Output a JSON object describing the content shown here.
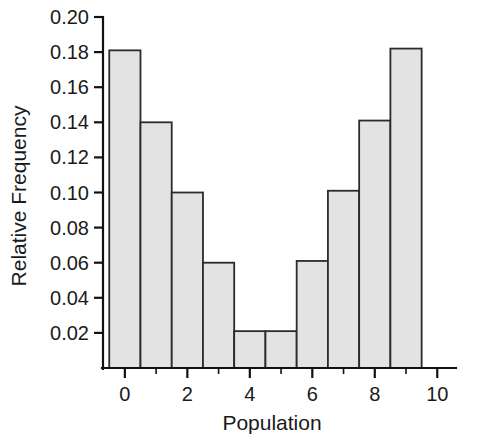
{
  "chart_data": {
    "type": "bar",
    "title": "",
    "subtitle": "",
    "xlabel": "Population",
    "ylabel": "Relative Frequency",
    "categories": [
      0,
      1,
      2,
      3,
      4,
      5,
      6,
      7,
      8,
      9
    ],
    "values": [
      0.181,
      0.14,
      0.1,
      0.06,
      0.021,
      0.021,
      0.061,
      0.101,
      0.141,
      0.182
    ],
    "series": [
      {
        "name": "Relative Frequency",
        "values": [
          0.181,
          0.14,
          0.1,
          0.06,
          0.021,
          0.021,
          0.061,
          0.101,
          0.141,
          0.182
        ]
      }
    ],
    "bar_width": 1.0,
    "xlim": [
      -0.7,
      10.6
    ],
    "ylim": [
      0.0,
      0.2
    ],
    "x_ticks_major": [
      0,
      2,
      4,
      6,
      8,
      10
    ],
    "x_tick_labels": [
      "0",
      "2",
      "4",
      "6",
      "8",
      "10"
    ],
    "x_ticks_minor": [
      1,
      3,
      5,
      7,
      9
    ],
    "y_ticks_major": [
      0.02,
      0.04,
      0.06,
      0.08,
      0.1,
      0.12,
      0.14,
      0.16,
      0.18,
      0.2
    ],
    "y_tick_labels": [
      "0.02",
      "0.04",
      "0.06",
      "0.08",
      "0.10",
      "0.12",
      "0.14",
      "0.16",
      "0.18",
      "0.20"
    ],
    "grid": false,
    "legend": false,
    "legend_position": "none",
    "bar_fill_color": "#e3e3e3",
    "bar_edge_color": "#2b2b2b",
    "axis_color": "#111111",
    "background_color": "#ffffff"
  },
  "axes": {
    "x_title": "Population",
    "y_title": "Relative Frequency"
  }
}
